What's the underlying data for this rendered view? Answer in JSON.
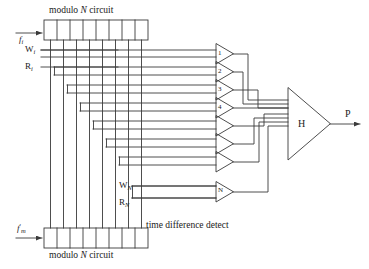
{
  "diagram": {
    "title_top": "modulo N circuit",
    "title_bottom": "modulo N circuit",
    "caption_detect": "time difference detect",
    "modulus_symbol": "N",
    "colors": {
      "line": "#3a3a3a",
      "text": "#1a1a1a",
      "background": "#ffffff"
    }
  },
  "inputs": [
    {
      "id": "f-i",
      "base": "f",
      "subscript": "i",
      "prime": "",
      "x": 18,
      "y": 36
    },
    {
      "id": "f-m-prime",
      "base": "f",
      "subscript": "m",
      "prime": "′",
      "x": 18,
      "y": 228
    }
  ],
  "registers": {
    "top": {
      "name": "modulo-n-register-top",
      "cells": 8,
      "x": 44,
      "y": 20,
      "width": 104,
      "height": 20
    },
    "bottom": {
      "name": "modulo-n-register-bottom",
      "cells": 8,
      "x": 44,
      "y": 228,
      "width": 104,
      "height": 20
    }
  },
  "signals": [
    {
      "label": "W",
      "subscript": "i",
      "x": 26,
      "y": 51,
      "name": "signal-w-i"
    },
    {
      "label": "R",
      "subscript": "i",
      "x": 26,
      "y": 68,
      "name": "signal-r-i"
    },
    {
      "label": "W",
      "subscript": "N",
      "x": 118,
      "y": 188,
      "name": "signal-w-n"
    },
    {
      "label": "R",
      "subscript": "N",
      "x": 118,
      "y": 205,
      "name": "signal-r-n"
    }
  ],
  "gates": [
    {
      "index": 1,
      "label": "1",
      "y": 57
    },
    {
      "index": 2,
      "label": "2",
      "y": 75
    },
    {
      "index": 3,
      "label": "3",
      "y": 93
    },
    {
      "index": 4,
      "label": "4",
      "y": 111
    },
    {
      "index": 5,
      "label": "",
      "y": 129
    },
    {
      "index": 6,
      "label": "",
      "y": 147
    },
    {
      "index": 7,
      "label": "",
      "y": 165
    },
    {
      "index": 8,
      "label": "N",
      "y": 192
    }
  ],
  "summing_block": {
    "label": "H",
    "name": "summing-amplifier-h",
    "x": 288,
    "y": 95
  },
  "output": {
    "label": "P",
    "name": "output-p",
    "x": 345,
    "y": 108
  }
}
